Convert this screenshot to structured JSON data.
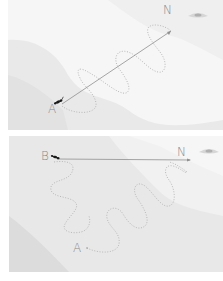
{
  "figure": {
    "panels": [
      {
        "id": "top",
        "start_label": "A",
        "nest_label": "N",
        "description": "Tortuous outbound path from nest N to A; straight homing vector back to N"
      },
      {
        "id": "bottom",
        "start_label": "B",
        "nest_label": "N",
        "origin_label": "A",
        "description": "Displaced insect at B runs straight vector parallel to original; meandering path from A"
      }
    ],
    "colors": {
      "background_light": "#f7f7f7",
      "background_shade": "#e6e6e6",
      "path_dotted": "#b5b5b5",
      "vector_line": "#8c8c8c",
      "label": "#8a8a8a",
      "insect": "#1a1a1a"
    },
    "icons": [
      "ant-icon",
      "landmark-eye-icon"
    ]
  }
}
